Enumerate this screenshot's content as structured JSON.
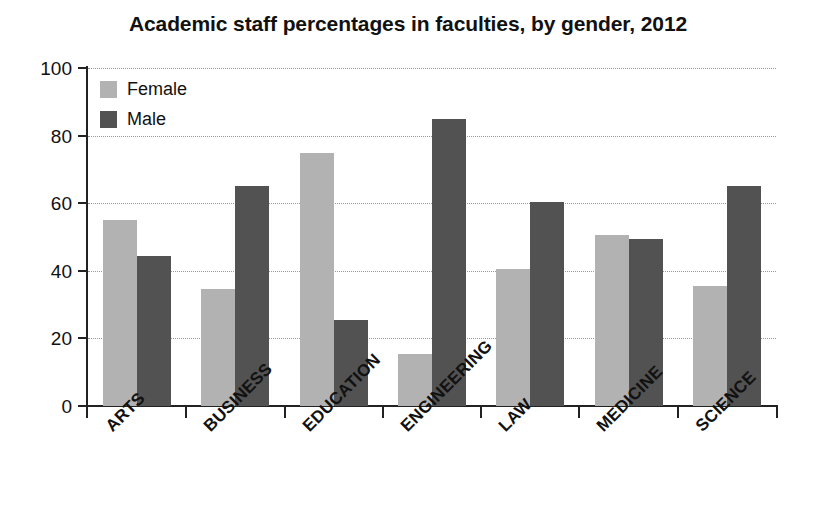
{
  "chart_data": {
    "type": "bar",
    "title": "Academic staff percentages in faculties, by gender, 2012",
    "xlabel": "",
    "ylabel": "",
    "ylim": [
      0,
      100
    ],
    "ytick_labels": [
      "0",
      "20",
      "40",
      "60",
      "80",
      "100"
    ],
    "ytick_values": [
      0,
      20,
      40,
      60,
      80,
      100
    ],
    "grid": true,
    "grid_style": "dotted horizontal",
    "legend_position": "top-left inside plot",
    "categories": [
      "ARTS",
      "BUSINESS",
      "EDUCATION",
      "ENGINEERING",
      "LAW",
      "MEDICINE",
      "SCIENCE"
    ],
    "series": [
      {
        "name": "Female",
        "color": "#b2b2b2",
        "values": [
          55,
          34.5,
          75,
          15.5,
          40.5,
          50.5,
          35.5
        ]
      },
      {
        "name": "Male",
        "color": "#525252",
        "values": [
          44.5,
          65,
          25.5,
          85,
          60.5,
          49.5,
          65
        ]
      }
    ]
  },
  "legend": {
    "items": [
      {
        "label": "Female",
        "swatch": "female"
      },
      {
        "label": "Male",
        "swatch": "male"
      }
    ]
  },
  "colors": {
    "female": "#b2b2b2",
    "male": "#525252",
    "axis": "#222222",
    "grid": "#9a9a9a",
    "text": "#111111",
    "background": "#ffffff"
  }
}
